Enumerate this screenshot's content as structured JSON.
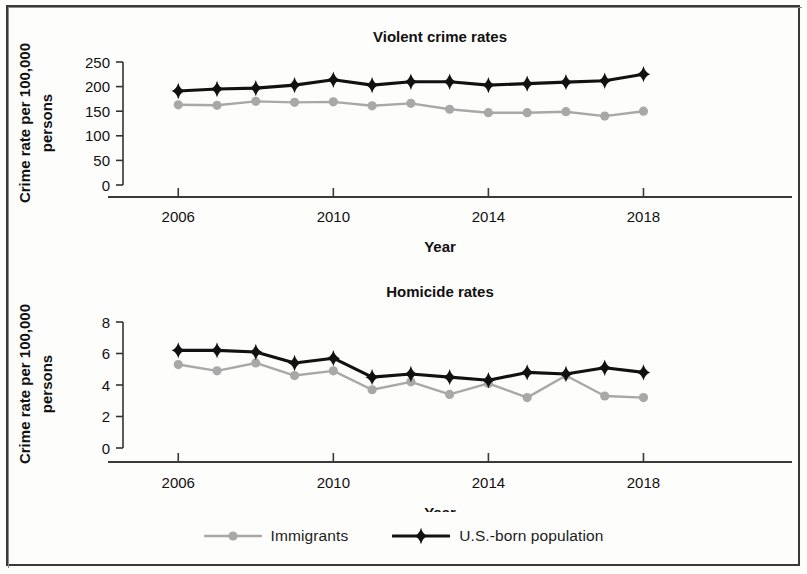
{
  "figure": {
    "legend": {
      "entries": [
        {
          "label": "Immigrants",
          "color": "#a8a8a8",
          "marker": "circle"
        },
        {
          "label": "U.S.-born population",
          "color": "#111111",
          "marker": "diamond"
        }
      ]
    }
  },
  "chart_data": [
    {
      "type": "line",
      "title": "Violent crime rates",
      "xlabel": "Year",
      "ylabel": "Crime rate per 100,000 persons",
      "x": [
        2006,
        2007,
        2008,
        2009,
        2010,
        2011,
        2012,
        2013,
        2014,
        2015,
        2016,
        2017,
        2018
      ],
      "xticks": [
        2006,
        2010,
        2014,
        2018
      ],
      "xtick_labels": [
        "2006",
        "2010",
        "2014",
        "2018"
      ],
      "xlim": [
        2005.4,
        2019.2
      ],
      "yticks": [
        0,
        50,
        100,
        150,
        200,
        250
      ],
      "ytick_labels": [
        "0",
        "50",
        "100",
        "150",
        "200",
        "250"
      ],
      "ylim": [
        0,
        250
      ],
      "grid": false,
      "legend_position": "figure-bottom-center",
      "series": [
        {
          "name": "U.S.-born population",
          "color": "#111111",
          "marker": "diamond",
          "values": [
            191,
            195,
            197,
            203,
            214,
            203,
            210,
            210,
            203,
            206,
            209,
            212,
            225
          ]
        },
        {
          "name": "Immigrants",
          "color": "#a8a8a8",
          "marker": "circle",
          "values": [
            163,
            162,
            170,
            168,
            169,
            161,
            166,
            154,
            147,
            147,
            149,
            140,
            150
          ]
        }
      ]
    },
    {
      "type": "line",
      "title": "Homicide rates",
      "xlabel": "Year",
      "ylabel": "Crime rate per 100,000 persons",
      "x": [
        2006,
        2007,
        2008,
        2009,
        2010,
        2011,
        2012,
        2013,
        2014,
        2015,
        2016,
        2017,
        2018
      ],
      "xticks": [
        2006,
        2010,
        2014,
        2018
      ],
      "xtick_labels": [
        "2006",
        "2010",
        "2014",
        "2018"
      ],
      "xlim": [
        2005.4,
        2019.2
      ],
      "yticks": [
        0,
        2,
        4,
        6,
        8
      ],
      "ytick_labels": [
        "0",
        "2",
        "4",
        "6",
        "8"
      ],
      "ylim": [
        0,
        8
      ],
      "grid": false,
      "legend_position": "figure-bottom-center",
      "series": [
        {
          "name": "U.S.-born population",
          "color": "#111111",
          "marker": "diamond",
          "values": [
            6.2,
            6.2,
            6.1,
            5.4,
            5.7,
            4.5,
            4.7,
            4.5,
            4.3,
            4.8,
            4.7,
            5.1,
            4.8
          ]
        },
        {
          "name": "Immigrants",
          "color": "#a8a8a8",
          "marker": "circle",
          "values": [
            5.3,
            4.9,
            5.4,
            4.6,
            4.9,
            3.7,
            4.2,
            3.4,
            4.1,
            3.2,
            4.6,
            3.3,
            3.2
          ]
        }
      ]
    }
  ]
}
